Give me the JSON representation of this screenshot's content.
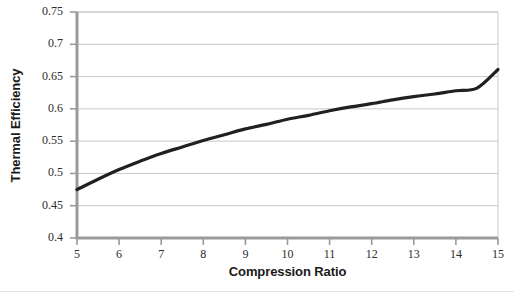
{
  "chart_data": {
    "type": "line",
    "title": "",
    "subtitle": "",
    "xlabel": "Compression Ratio",
    "ylabel": "Thermal Efficiency",
    "xlim": [
      5,
      15
    ],
    "ylim": [
      0.4,
      0.75
    ],
    "grid": "horizontal",
    "legend": "none",
    "xticks": [
      "5",
      "6",
      "7",
      "8",
      "9",
      "10",
      "11",
      "12",
      "13",
      "14",
      "15"
    ],
    "yticks": [
      "0.4",
      "0.45",
      "0.5",
      "0.55",
      "0.6",
      "0.65",
      "0.7",
      "0.75"
    ],
    "xtick_values": [
      5,
      6,
      7,
      8,
      9,
      10,
      11,
      12,
      13,
      14,
      15
    ],
    "ytick_values": [
      0.4,
      0.45,
      0.5,
      0.55,
      0.6,
      0.65,
      0.7,
      0.75
    ],
    "series": [
      {
        "name": "Thermal Efficiency",
        "color": "#231f20",
        "line_width": 3.2,
        "x": [
          5,
          5.5,
          6,
          6.5,
          7,
          7.5,
          8,
          8.5,
          9,
          9.5,
          10,
          10.5,
          11,
          11.5,
          12,
          12.5,
          13,
          13.5,
          14,
          14.5,
          15
        ],
        "values": [
          0.475,
          0.491,
          0.506,
          0.519,
          0.531,
          0.541,
          0.551,
          0.56,
          0.569,
          0.576,
          0.584,
          0.59,
          0.597,
          0.603,
          0.608,
          0.614,
          0.619,
          0.623,
          0.628,
          0.632,
          0.661
        ]
      }
    ],
    "annotations": []
  },
  "axis": {
    "y_title": "Thermal Efficiency",
    "x_title": "Compression Ratio"
  },
  "colors": {
    "curve": "#231f20",
    "gridline": "#c9c9c9",
    "axis": "#9a9a9a",
    "plot_border": "#c9c9c9",
    "background": "#ffffff",
    "tick_text": "#2b2b2b",
    "title_text": "#1a1a1a"
  }
}
